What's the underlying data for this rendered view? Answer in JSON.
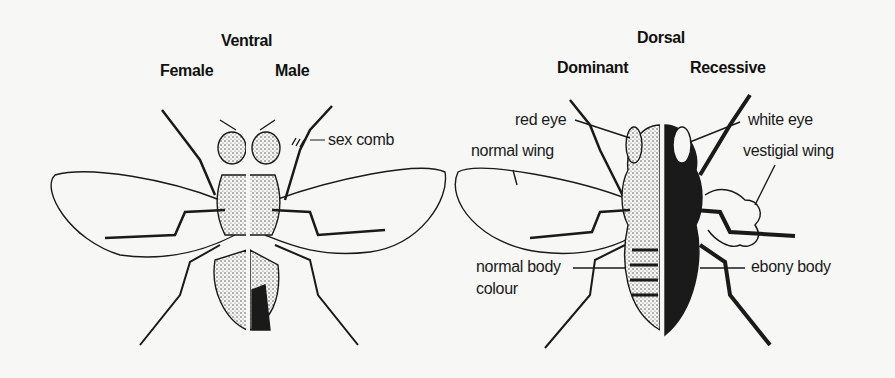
{
  "ventral": {
    "title": "Ventral",
    "left_label": "Female",
    "right_label": "Male",
    "annotations": {
      "sex_comb": "sex comb"
    }
  },
  "dorsal": {
    "title": "Dorsal",
    "left_label": "Dominant",
    "right_label": "Recessive",
    "annotations": {
      "red_eye": "red eye",
      "normal_wing": "normal wing",
      "normal_body_line1": "normal body",
      "normal_body_line2": "colour",
      "white_eye": "white eye",
      "vestigial_wing": "vestigial wing",
      "ebony_body": "ebony body"
    }
  },
  "colors": {
    "ink": "#1a1a1a",
    "paper": "#f7f7f5",
    "stipple": "#bdbdbd"
  }
}
